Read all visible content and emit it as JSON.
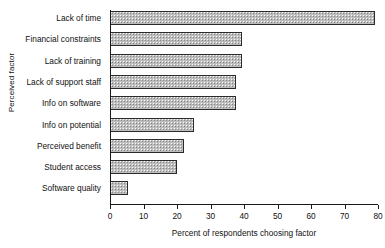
{
  "chart_data": {
    "type": "bar",
    "orientation": "horizontal",
    "title": "",
    "xlabel": "Percent of respondents choosing factor",
    "ylabel": "Perceived factor",
    "categories": [
      "Lack of time",
      "Financial constraints",
      "Lack of training",
      "Lack of support staff",
      "Info on software",
      "Info on potential",
      "Perceived benefit",
      "Student access",
      "Software quality"
    ],
    "values": [
      79,
      39.5,
      39.5,
      37.5,
      37.5,
      25,
      22,
      20,
      5.5
    ],
    "xlim": [
      0,
      80
    ],
    "xticks": [
      0,
      10,
      20,
      30,
      40,
      50,
      60,
      70,
      80
    ],
    "xtick_labels": [
      "0",
      "10",
      "20",
      "30",
      "40",
      "50",
      "60",
      "70",
      "80"
    ],
    "grid": false,
    "legend": null,
    "bar_fill_color": "#bdbdbd",
    "bar_border_color": "#2b2b2b",
    "background_color": "#ffffff"
  }
}
